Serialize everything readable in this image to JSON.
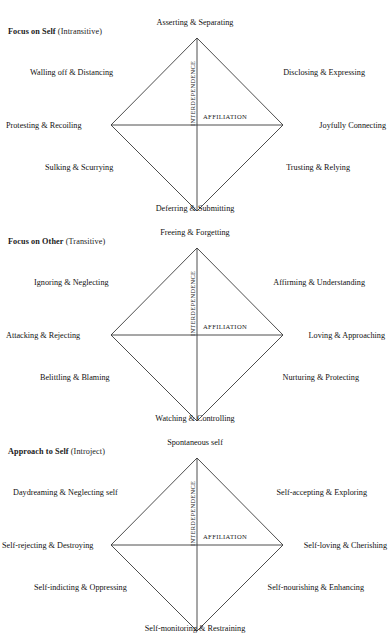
{
  "figure": {
    "axis_vertical_label": "INTERDEPENDENCE",
    "axis_horizontal_label": "AFFILIATION",
    "artifact_text": "·  ·           ·"
  },
  "blocks": [
    {
      "title_strong": "Focus on Self",
      "title_paren": "(Intransitive)",
      "poles": {
        "top": "Asserting & Separating",
        "upper_left": "Walling off & Distancing",
        "upper_right": "Disclosing & Expressing",
        "left": "Protesting & Recoiling",
        "right": "Joyfully Connecting",
        "lower_left": "Sulking & Scurrying",
        "lower_right": "Trusting & Relying",
        "bottom": "Deferring & Submitting"
      },
      "axis_vertical_label": "INTERDEPENDENCE",
      "axis_horizontal_label": "AFFILIATION"
    },
    {
      "title_strong": "Focus on Other",
      "title_paren": "(Transitive)",
      "poles": {
        "top": "Freeing & Forgetting",
        "upper_left": "Ignoring & Neglecting",
        "upper_right": "Affirming & Understanding",
        "left": "Attacking & Rejecting",
        "right": "Loving & Approaching",
        "lower_left": "Belittling & Blaming",
        "lower_right": "Nurturing & Protecting",
        "bottom": "Watching & Controlling"
      },
      "axis_vertical_label": "INTERDEPENDENCE",
      "axis_horizontal_label": "AFFILIATION"
    },
    {
      "title_strong": "Approach to Self",
      "title_paren": "(Introject)",
      "poles": {
        "top": "Spontaneous self",
        "upper_left": "Daydreaming & Neglecting self",
        "upper_right": "Self-accepting & Exploring",
        "left": "Self-rejecting & Destroying",
        "right": "Self-loving & Cherishing",
        "lower_left": "Self-indicting & Oppressing",
        "lower_right": "Self-nourishing & Enhancing",
        "bottom": "Self-monitoring & Restraining"
      },
      "axis_vertical_label": "INTERDEPENDENCE",
      "axis_horizontal_label": "AFFILIATION"
    }
  ],
  "colors": {
    "line": "#3a3a3a",
    "text": "#1a1a1a",
    "background": "#ffffff"
  }
}
